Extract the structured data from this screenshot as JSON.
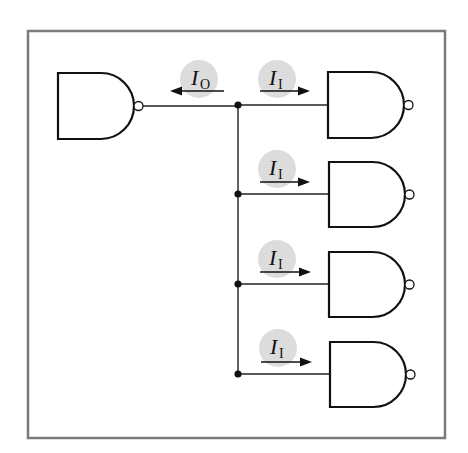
{
  "diagram": {
    "title": "",
    "frame": {
      "x": 28,
      "y": 31,
      "width": 417,
      "height": 407,
      "color": "#7a7a7a"
    },
    "colors": {
      "stroke": "#111111",
      "label_bg": "#dcdcdc",
      "frame": "#7a7a7a"
    },
    "driver_gate": {
      "type": "NAND",
      "x": 58,
      "y": 73,
      "width": 76,
      "height": 66,
      "output_y": 105
    },
    "bus": {
      "x": 238,
      "y_top": 105,
      "y_bottom": 374
    },
    "output_current": {
      "label_main": "I",
      "label_sub": "O",
      "direction": "left",
      "circle": {
        "cx": 199,
        "cy": 79,
        "r": 19
      },
      "arrow": {
        "x1": 224,
        "x2": 170,
        "y": 91
      }
    },
    "load_gates": [
      {
        "type": "NAND",
        "x": 328,
        "y": 72,
        "width": 76,
        "height": 66,
        "input_y": 105,
        "current": {
          "label_main": "I",
          "label_sub": "I",
          "direction": "right",
          "circle": {
            "cx": 277,
            "cy": 79,
            "r": 19
          },
          "arrow": {
            "x1": 260,
            "x2": 310,
            "y": 91
          }
        }
      },
      {
        "type": "NAND",
        "x": 329,
        "y": 162,
        "width": 76,
        "height": 65,
        "input_y": 194,
        "current": {
          "label_main": "I",
          "label_sub": "I",
          "direction": "right",
          "circle": {
            "cx": 277,
            "cy": 169,
            "r": 19
          },
          "arrow": {
            "x1": 260,
            "x2": 310,
            "y": 182
          }
        }
      },
      {
        "type": "NAND",
        "x": 329,
        "y": 252,
        "width": 76,
        "height": 65,
        "input_y": 284,
        "current": {
          "label_main": "I",
          "label_sub": "I",
          "direction": "right",
          "circle": {
            "cx": 277,
            "cy": 259,
            "r": 19
          },
          "arrow": {
            "x1": 260,
            "x2": 311,
            "y": 272
          }
        }
      },
      {
        "type": "NAND",
        "x": 330,
        "y": 342,
        "width": 76,
        "height": 65,
        "input_y": 374,
        "current": {
          "label_main": "I",
          "label_sub": "I",
          "direction": "right",
          "circle": {
            "cx": 278,
            "cy": 348,
            "r": 19
          },
          "arrow": {
            "x1": 261,
            "x2": 312,
            "y": 362
          }
        }
      }
    ]
  }
}
